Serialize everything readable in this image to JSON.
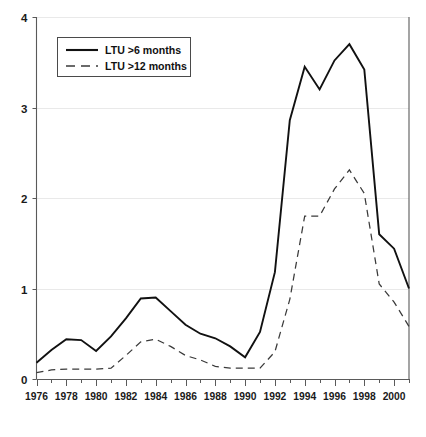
{
  "chart_data": {
    "type": "line",
    "title": "",
    "subtitle": "",
    "xlabel": "",
    "ylabel": "",
    "xlim": [
      1976,
      2001
    ],
    "ylim": [
      0,
      4
    ],
    "yticks": [
      0,
      1,
      2,
      3,
      4
    ],
    "ytick_labels": [
      "0",
      "1",
      "2",
      "3",
      "4"
    ],
    "xticks": [
      1976,
      1978,
      1980,
      1982,
      1984,
      1986,
      1988,
      1990,
      1992,
      1994,
      1996,
      1998,
      2000
    ],
    "xtick_labels": [
      "1976",
      "1978",
      "1980",
      "1982",
      "1984",
      "1986",
      "1988",
      "1990",
      "1992",
      "1994",
      "1996",
      "1998",
      "2000"
    ],
    "x": [
      1976,
      1977,
      1978,
      1979,
      1980,
      1981,
      1982,
      1983,
      1984,
      1985,
      1986,
      1987,
      1988,
      1989,
      1990,
      1991,
      1992,
      1993,
      1994,
      1995,
      1996,
      1997,
      1998,
      1999,
      2000,
      2001
    ],
    "grid": "horizontal",
    "legend_position": "top-left",
    "series": [
      {
        "name": "LTU >6 months",
        "style": "solid",
        "color": "#111111",
        "values": [
          0.18,
          0.32,
          0.44,
          0.43,
          0.31,
          0.47,
          0.67,
          0.89,
          0.9,
          0.75,
          0.6,
          0.5,
          0.45,
          0.36,
          0.24,
          0.52,
          1.18,
          2.86,
          3.45,
          3.2,
          3.52,
          3.7,
          3.42,
          1.6,
          1.44,
          1.0
        ]
      },
      {
        "name": "LTU >12 months",
        "style": "dashed",
        "color": "#3a3a3a",
        "values": [
          0.07,
          0.1,
          0.11,
          0.11,
          0.11,
          0.12,
          0.26,
          0.41,
          0.44,
          0.36,
          0.26,
          0.21,
          0.14,
          0.12,
          0.12,
          0.12,
          0.3,
          0.88,
          1.8,
          1.8,
          2.1,
          2.31,
          2.05,
          1.05,
          0.85,
          0.58
        ]
      }
    ],
    "legend": [
      {
        "label": "LTU >6 months",
        "style": "solid"
      },
      {
        "label": "LTU >12 months",
        "style": "dashed"
      }
    ]
  }
}
